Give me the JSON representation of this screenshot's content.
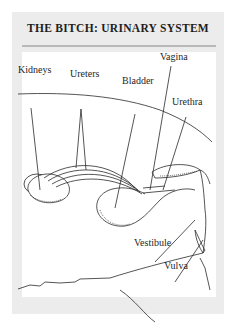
{
  "figure": {
    "title": "THE BITCH: URINARY SYSTEM",
    "labels": {
      "kidneys": "Kidneys",
      "ureters": "Ureters",
      "bladder": "Bladder",
      "vagina": "Vagina",
      "urethra": "Urethra",
      "vestibule": "Vestibule",
      "vulva": "Vulva"
    }
  },
  "colors": {
    "card_bg": "#ececec",
    "plate_bg": "#ffffff",
    "line": "#2a2a2a",
    "text": "#1e1e1e"
  }
}
